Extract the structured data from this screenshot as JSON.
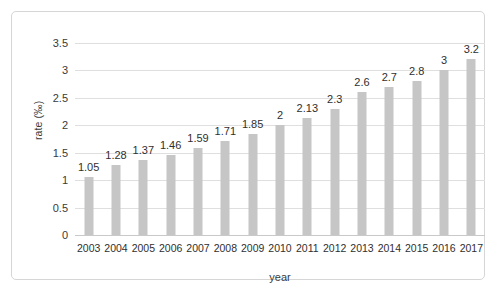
{
  "chart_data": {
    "type": "bar",
    "title": "",
    "xlabel": "year",
    "ylabel": "rate (‰)",
    "categories": [
      "2003",
      "2004",
      "2005",
      "2006",
      "2007",
      "2008",
      "2009",
      "2010",
      "2011",
      "2012",
      "2013",
      "2014",
      "2015",
      "2016",
      "2017"
    ],
    "values": [
      1.05,
      1.28,
      1.37,
      1.46,
      1.59,
      1.71,
      1.85,
      2,
      2.13,
      2.3,
      2.6,
      2.7,
      2.8,
      3,
      3.2
    ],
    "value_labels": [
      "1.05",
      "1.28",
      "1.37",
      "1.46",
      "1.59",
      "1.71",
      "1.85",
      "2",
      "2.13",
      "2.3",
      "2.6",
      "2.7",
      "2.8",
      "3",
      "3.2"
    ],
    "ylim": [
      0,
      3.5
    ],
    "yticks": [
      0,
      0.5,
      1,
      1.5,
      2,
      2.5,
      3,
      3.5
    ],
    "ytick_labels": [
      "0",
      "0.5",
      "1",
      "1.5",
      "2",
      "2.5",
      "3",
      "3.5"
    ],
    "grid": true,
    "legend": false,
    "legend_position": "none",
    "series_color": "#c6c6c6",
    "gridline_color": "#dfdfdf",
    "axis_color": "#c9c9c9",
    "background_color": "#ffffff",
    "frame_color": "#d6d6d6"
  }
}
